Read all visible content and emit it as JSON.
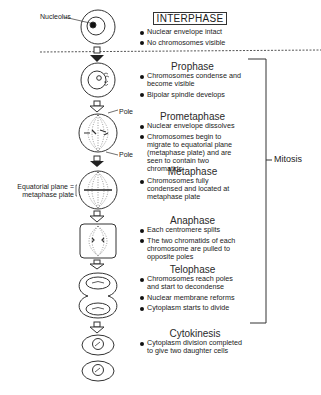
{
  "diagram": {
    "labels": {
      "nucleolus": "Nucleolus",
      "pole_top": "Pole",
      "pole_bottom": "Pole",
      "equatorial_line1": "Equatorial plane =",
      "equatorial_line2": "metaphase plate",
      "mitosis": "Mitosis"
    },
    "stages": [
      {
        "name": "INTERPHASE",
        "bullets": [
          "Nuclear envelope intact",
          "No chromosomes visible"
        ]
      },
      {
        "name": "Prophase",
        "bullets": [
          "Chromosomes condense and become visible",
          "Bipolar spindle develops"
        ]
      },
      {
        "name": "Prometaphase",
        "bullets": [
          "Nuclear envelope dissolves",
          "Chromosomes begin to migrate to equatorial plane (metaphase plate) and are seen to contain two chromatids"
        ]
      },
      {
        "name": "Metaphase",
        "bullets": [
          "Chromosomes fully condensed and located at metaphase plate"
        ]
      },
      {
        "name": "Anaphase",
        "bullets": [
          "Each centromere splits",
          "The two chromatids of each chromosome are pulled to opposite poles"
        ]
      },
      {
        "name": "Telophase",
        "bullets": [
          "Chromosomes reach poles and start to decondense",
          "Nuclear membrane reforms",
          "Cytoplasm starts to divide"
        ]
      },
      {
        "name": "Cytokinesis",
        "bullets": [
          "Cytoplasm division completed to give two daughter cells"
        ]
      }
    ],
    "colors": {
      "line": "#333333",
      "text": "#1a1a1a",
      "dashed_separator": "#555555"
    }
  }
}
